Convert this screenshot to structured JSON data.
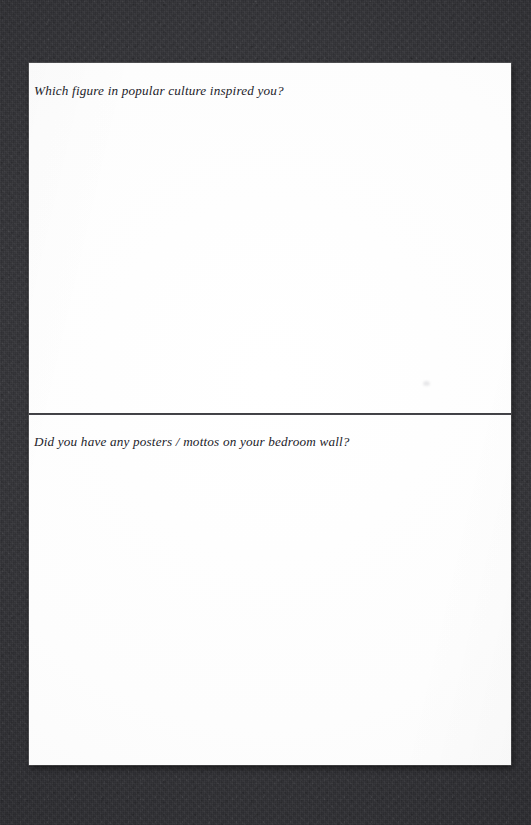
{
  "page": {
    "background_color": "#333337",
    "paper_color": "#fefefe",
    "ink_color": "#23232a",
    "divider_color": "#3a3a3e"
  },
  "sections": [
    {
      "id": "section-1",
      "prompt": "Which figure in popular culture inspired you?",
      "answer": ""
    },
    {
      "id": "section-2",
      "prompt": "Did you have any posters / mottos on your bedroom wall?",
      "answer": ""
    }
  ]
}
